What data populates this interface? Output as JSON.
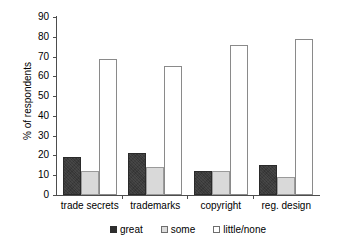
{
  "chart_data": {
    "type": "bar",
    "title": "",
    "subtitle": "",
    "xlabel": "",
    "ylabel": "% of respondents",
    "ylim": [
      0,
      90
    ],
    "yticks": [
      90,
      80,
      70,
      60,
      50,
      40,
      30,
      20,
      10,
      0
    ],
    "ytick_labels": [
      "90",
      "80",
      "70",
      "60",
      "50",
      "40",
      "30",
      "20",
      "10",
      "0"
    ],
    "grid": false,
    "legend_position": "bottom",
    "categories": [
      "trade secrets",
      "trademarks",
      "copyright",
      "reg. design"
    ],
    "series": [
      {
        "name": "great",
        "color": "#3b3b3b",
        "values": [
          19,
          21,
          12,
          15
        ]
      },
      {
        "name": "some",
        "color": "#d9d9d9",
        "values": [
          12,
          14,
          12,
          9
        ]
      },
      {
        "name": "little/none",
        "color": "#ffffff",
        "values": [
          69,
          65,
          76,
          79
        ]
      }
    ],
    "annotations": []
  },
  "axis": {
    "y_title": "% of respondents"
  },
  "legend": {
    "items": [
      {
        "label": "great"
      },
      {
        "label": "some"
      },
      {
        "label": "little/none"
      }
    ]
  }
}
